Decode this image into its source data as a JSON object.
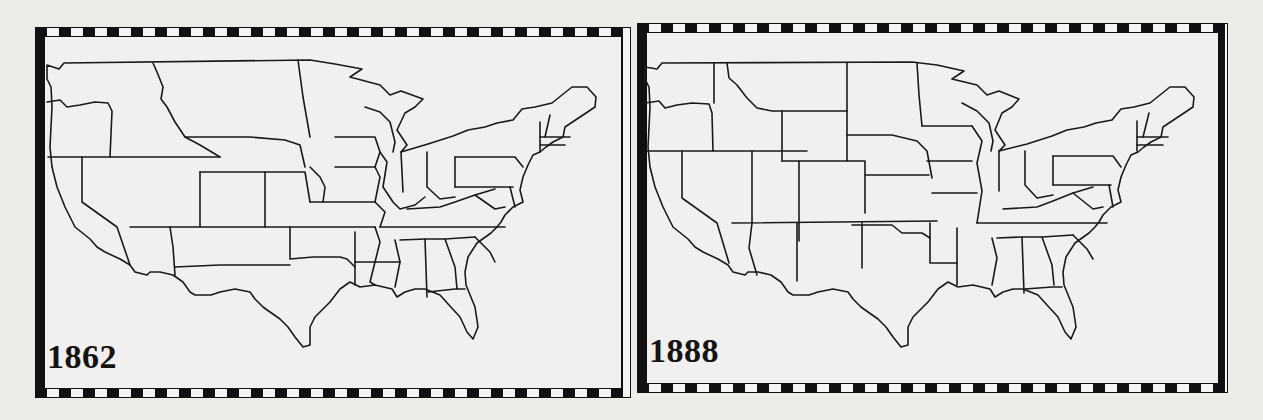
{
  "figure": {
    "border_style": "checkered black-and-white frame",
    "colors": {
      "ink": "#111111",
      "paper": "#ecebe8",
      "frame_light": "#f4f4f2"
    }
  },
  "maps": [
    {
      "id": "map-1862",
      "year_label": "1862",
      "position": "left"
    },
    {
      "id": "map-1888",
      "year_label": "1888",
      "position": "right"
    }
  ]
}
